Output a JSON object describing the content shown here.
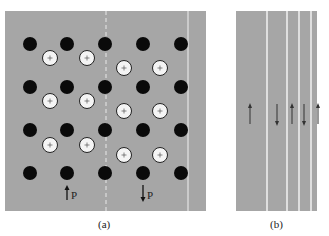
{
  "panel_a": {
    "caption": "(a)",
    "label_up": "P",
    "label_down": "P",
    "background": "#a6a6a6"
  },
  "panel_b": {
    "caption": "(b)",
    "arrows": [
      "up",
      "down",
      "up",
      "down",
      "up"
    ]
  },
  "symbols": {
    "positive_ion": "+",
    "negative_ion": "black-dot"
  }
}
